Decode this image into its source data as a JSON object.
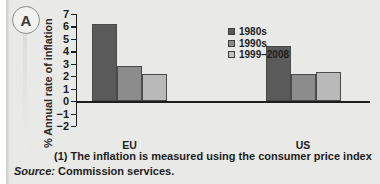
{
  "badge": {
    "label": "A"
  },
  "chart_data": {
    "type": "bar",
    "title": "",
    "xlabel": "",
    "ylabel": "% Annual rate of inflation",
    "categories": [
      "EU",
      "US",
      "JAPAN"
    ],
    "series": [
      {
        "name": "1980s",
        "color": "#5a5a5a",
        "values": [
          6.2,
          4.4,
          2.1
        ]
      },
      {
        "name": "1990s",
        "color": "#8c8c8c",
        "values": [
          2.8,
          2.2,
          0.3
        ]
      },
      {
        "name": "1999–2008",
        "color": "#b9b9b9",
        "values": [
          2.2,
          2.3,
          -0.8
        ]
      }
    ],
    "ylim": [
      -2,
      7
    ],
    "yticks": [
      7,
      6,
      5,
      4,
      3,
      2,
      1,
      0,
      "−1",
      "−2"
    ],
    "ytick_values": [
      7,
      6,
      5,
      4,
      3,
      2,
      1,
      0,
      -1,
      -2
    ],
    "grid": false,
    "legend_position": "upper-right",
    "zero_line": true
  },
  "legend": {
    "entries": [
      {
        "label": "1980s",
        "color": "#5a5a5a"
      },
      {
        "label": "1990s",
        "color": "#8c8c8c"
      },
      {
        "label": "1999–2008",
        "color": "#c3c3c3"
      }
    ]
  },
  "footnotes": {
    "note": "(1)  The inflation is measured using the consumer price index",
    "source_word": "Source:",
    "source_value": " Commission services."
  }
}
